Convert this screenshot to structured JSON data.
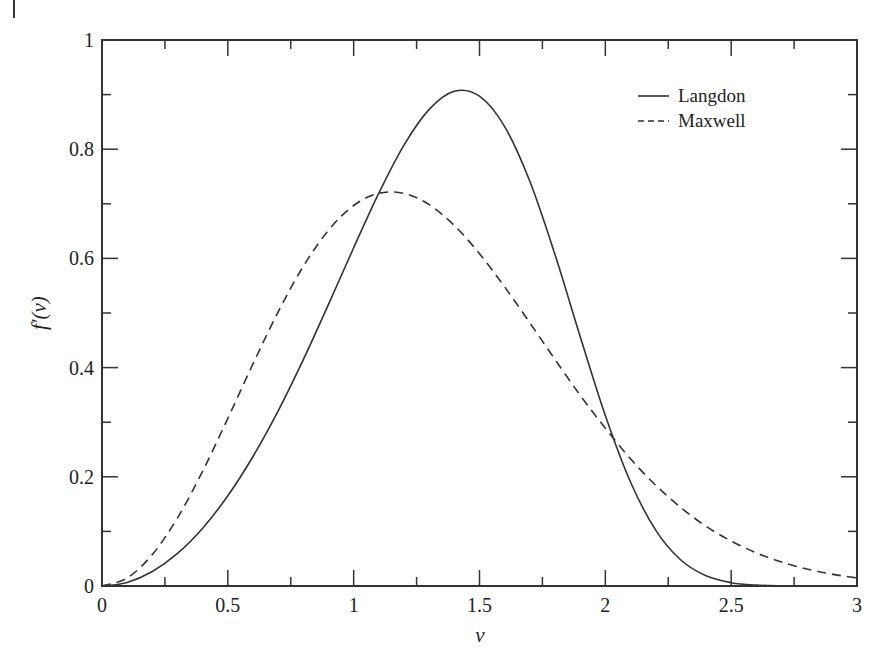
{
  "chart_data": {
    "type": "line",
    "title": "",
    "xlabel": "v",
    "ylabel": "f′(v)",
    "xlim": [
      0,
      3
    ],
    "ylim": [
      0,
      1
    ],
    "grid": false,
    "legend_position": "upper right",
    "x_ticks": [
      0,
      0.5,
      1,
      1.5,
      2,
      2.5,
      3
    ],
    "x_tick_labels": [
      "0",
      "0.5",
      "1",
      "1.5",
      "2",
      "2.5",
      "3"
    ],
    "y_ticks": [
      0,
      0.2,
      0.4,
      0.6,
      0.8,
      1
    ],
    "y_tick_labels": [
      "0",
      "0.2",
      "0.4",
      "0.6",
      "0.8",
      "1"
    ],
    "x": [
      0,
      0.1,
      0.2,
      0.3,
      0.4,
      0.5,
      0.6,
      0.7,
      0.8,
      0.9,
      1.0,
      1.1,
      1.2,
      1.3,
      1.4,
      1.5,
      1.6,
      1.7,
      1.8,
      1.9,
      2.0,
      2.1,
      2.2,
      2.3,
      2.4,
      2.5,
      2.6,
      2.7,
      2.8,
      2.9,
      3.0
    ],
    "series": [
      {
        "name": "Langdon",
        "style": "solid",
        "values": [
          0,
          0.0066,
          0.0265,
          0.0596,
          0.1059,
          0.1652,
          0.2372,
          0.3208,
          0.4146,
          0.5157,
          0.6195,
          0.7196,
          0.8076,
          0.8729,
          0.9061,
          0.8971,
          0.8414,
          0.7412,
          0.607,
          0.4571,
          0.3123,
          0.1904,
          0.1024,
          0.0476,
          0.0187,
          0.0061,
          0.0016,
          0.0003,
          0,
          0,
          0
        ]
      },
      {
        "name": "Maxwell",
        "style": "dashed",
        "values": [
          0,
          0.0147,
          0.0576,
          0.1248,
          0.2104,
          0.3071,
          0.4069,
          0.502,
          0.5855,
          0.6515,
          0.6969,
          0.7193,
          0.719,
          0.6984,
          0.6602,
          0.6087,
          0.5478,
          0.482,
          0.4149,
          0.3493,
          0.2891,
          0.233,
          0.1846,
          0.1437,
          0.1094,
          0.0823,
          0.0606,
          0.0438,
          0.0312,
          0.0217,
          0.0148
        ]
      }
    ]
  },
  "legend": {
    "items": [
      {
        "label": "Langdon",
        "style": "solid"
      },
      {
        "label": "Maxwell",
        "style": "dashed"
      }
    ]
  },
  "colors": {
    "line": "#333333",
    "axis": "#333333",
    "background": "#ffffff"
  }
}
